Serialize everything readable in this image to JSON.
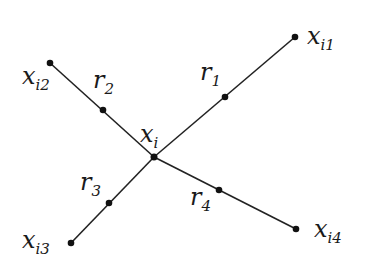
{
  "diagram": {
    "type": "star-graph",
    "center": {
      "id": "xi",
      "label": "x",
      "sub": "i",
      "x": 154,
      "y": 157,
      "lx": 140,
      "ly": 142
    },
    "branches": [
      {
        "id": "b1",
        "end": {
          "label": "x",
          "sub": "i1",
          "x": 295,
          "y": 37,
          "lx": 307,
          "ly": 44
        },
        "mid": {
          "label": "r",
          "sub": "1",
          "x": 225,
          "y": 97,
          "lx": 200,
          "ly": 80
        }
      },
      {
        "id": "b2",
        "end": {
          "label": "x",
          "sub": "i2",
          "x": 50,
          "y": 63,
          "lx": 22,
          "ly": 84
        },
        "mid": {
          "label": "r",
          "sub": "2",
          "x": 103,
          "y": 110,
          "lx": 93,
          "ly": 88
        }
      },
      {
        "id": "b3",
        "end": {
          "label": "x",
          "sub": "i3",
          "x": 71,
          "y": 243,
          "lx": 22,
          "ly": 248
        },
        "mid": {
          "label": "r",
          "sub": "3",
          "x": 109,
          "y": 203,
          "lx": 80,
          "ly": 190
        }
      },
      {
        "id": "b4",
        "end": {
          "label": "x",
          "sub": "i4",
          "x": 296,
          "y": 229,
          "lx": 314,
          "ly": 237
        },
        "mid": {
          "label": "r",
          "sub": "4",
          "x": 219,
          "y": 190,
          "lx": 190,
          "ly": 205
        }
      }
    ],
    "colors": {
      "line": "#222222",
      "point": "#111111",
      "text": "#1a1a1a",
      "background": "#ffffff"
    }
  }
}
